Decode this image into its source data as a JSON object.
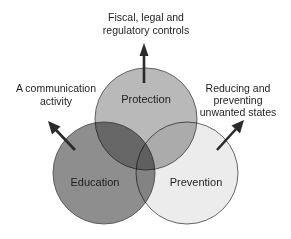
{
  "diagram": {
    "type": "venn",
    "circles": [
      {
        "id": "protection",
        "label": "Protection",
        "fill": "#b9b9b9"
      },
      {
        "id": "education",
        "label": "Education",
        "fill": "#8e8e8e"
      },
      {
        "id": "prevention",
        "label": "Prevention",
        "fill": "#ececec"
      }
    ],
    "annotations": {
      "top": {
        "lines": [
          "Fiscal, legal and",
          "regulatory controls"
        ],
        "points_from": "Protection"
      },
      "left": {
        "lines": [
          "A communication",
          "activity"
        ],
        "points_from": "Education"
      },
      "right": {
        "lines": [
          "Reducing and",
          "preventing",
          "unwanted states"
        ],
        "points_from": "Prevention"
      }
    },
    "colors": {
      "outline": "#555555",
      "arrow": "#2a2a2a",
      "text": "#1e1e1e",
      "background": "#ffffff"
    }
  }
}
